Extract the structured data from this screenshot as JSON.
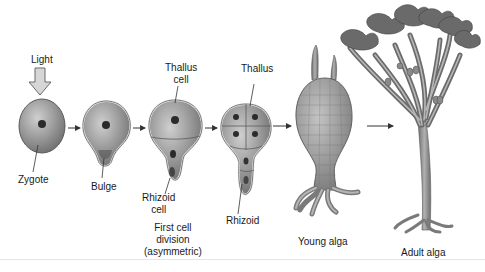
{
  "diagram": {
    "stimulus": {
      "label": "Light",
      "icon": "down-arrow-icon"
    },
    "stages": [
      {
        "id": "zygote",
        "labels": [
          "Zygote"
        ]
      },
      {
        "id": "bulge",
        "labels": [
          "Bulge"
        ]
      },
      {
        "id": "first-division",
        "labels": [
          "Thallus cell",
          "Rhizoid cell"
        ],
        "caption": [
          "First cell",
          "division",
          "(asymmetric)"
        ]
      },
      {
        "id": "four-cell",
        "labels": [
          "Thallus",
          "Rhizoid"
        ]
      },
      {
        "id": "young-alga",
        "caption": [
          "Young alga"
        ]
      },
      {
        "id": "adult-alga",
        "caption": [
          "Adult alga"
        ]
      }
    ],
    "labels": {
      "light": "Light",
      "zygote": "Zygote",
      "bulge": "Bulge",
      "thallus_cell_1": "Thallus",
      "thallus_cell_2": "cell",
      "rhizoid_cell_1": "Rhizoid",
      "rhizoid_cell_2": "cell",
      "thallus": "Thallus",
      "rhizoid": "Rhizoid",
      "first_div_1": "First cell",
      "first_div_2": "division",
      "first_div_3": "(asymmetric)",
      "young_alga": "Young alga",
      "adult_alga": "Adult alga"
    },
    "colors": {
      "cell_fill": "#8f8f8f",
      "cell_highlight": "#c9c9c9",
      "cell_outline": "#5a5a5a",
      "nucleus": "#2b2b2b",
      "alga_fill": "#9a9a9a",
      "arrow": "#333333"
    }
  }
}
